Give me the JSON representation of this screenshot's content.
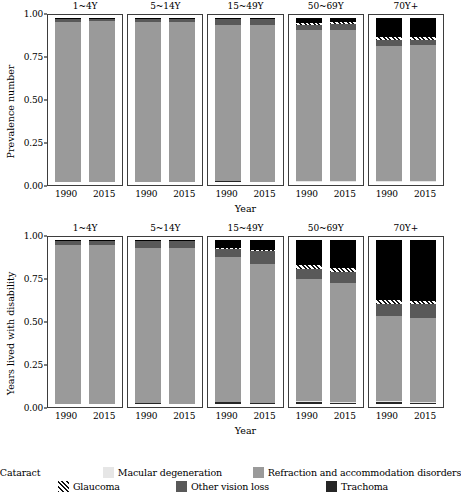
{
  "figure": {
    "xaxis_title": "Year",
    "facets": [
      "1~4Y",
      "5~14Y",
      "15~49Y",
      "50~69Y",
      "70Y+"
    ],
    "years": [
      "1990",
      "2015"
    ]
  },
  "legend": {
    "rows": [
      [
        {
          "label": "Cataract",
          "key": "cataract",
          "color": "#000000",
          "pattern": "solid"
        },
        {
          "label": "Macular degeneration",
          "key": "macular_degeneration",
          "color": "#e6e6e6",
          "pattern": "solid"
        },
        {
          "label": "Refraction and accommodation disorders",
          "key": "refraction",
          "color": "#9a9a9a",
          "pattern": "solid"
        }
      ],
      [
        {
          "label": "Glaucoma",
          "key": "glaucoma",
          "color": "#ffffff",
          "pattern": "hatch"
        },
        {
          "label": "Other vision loss",
          "key": "other_vision_loss",
          "color": "#595959",
          "pattern": "solid"
        },
        {
          "label": "Trachoma",
          "key": "trachoma",
          "color": "#262626",
          "pattern": "solid"
        }
      ]
    ]
  },
  "chart_data": [
    {
      "type": "bar",
      "id": "prevalence",
      "title": "",
      "ylabel": "Prevalence number",
      "xlabel": "Year",
      "ylim": [
        0,
        1
      ],
      "yticks": [
        "0.00",
        "0.25",
        "0.50",
        "0.75",
        "1.00"
      ],
      "ytickvalues": [
        0,
        0.25,
        0.5,
        0.75,
        1
      ],
      "stacked": "fill",
      "grid": false,
      "legend_position": "bottom",
      "series": [
        {
          "name": "Trachoma",
          "key": "trachoma"
        },
        {
          "name": "Macular degeneration",
          "key": "macular_degeneration"
        },
        {
          "name": "Refraction and accommodation disorders",
          "key": "refraction"
        },
        {
          "name": "Other vision loss",
          "key": "other_vision_loss"
        },
        {
          "name": "Glaucoma",
          "key": "glaucoma"
        },
        {
          "name": "Cataract",
          "key": "cataract"
        }
      ],
      "panels": [
        {
          "facet": "1~4Y",
          "bars": [
            {
              "year": "1990",
              "values": {
                "trachoma": 0.001,
                "macular_degeneration": 0.0,
                "refraction": 0.977,
                "other_vision_loss": 0.021,
                "glaucoma": 0.0,
                "cataract": 0.001
              }
            },
            {
              "year": "2015",
              "values": {
                "trachoma": 0.001,
                "macular_degeneration": 0.0,
                "refraction": 0.979,
                "other_vision_loss": 0.019,
                "glaucoma": 0.0,
                "cataract": 0.001
              }
            }
          ]
        },
        {
          "facet": "5~14Y",
          "bars": [
            {
              "year": "1990",
              "values": {
                "trachoma": 0.002,
                "macular_degeneration": 0.0,
                "refraction": 0.972,
                "other_vision_loss": 0.025,
                "glaucoma": 0.0,
                "cataract": 0.001
              }
            },
            {
              "year": "2015",
              "values": {
                "trachoma": 0.002,
                "macular_degeneration": 0.0,
                "refraction": 0.972,
                "other_vision_loss": 0.025,
                "glaucoma": 0.0,
                "cataract": 0.001
              }
            }
          ]
        },
        {
          "facet": "15~49Y",
          "bars": [
            {
              "year": "1990",
              "values": {
                "trachoma": 0.004,
                "macular_degeneration": 0.0,
                "refraction": 0.951,
                "other_vision_loss": 0.038,
                "glaucoma": 0.002,
                "cataract": 0.005
              }
            },
            {
              "year": "2015",
              "values": {
                "trachoma": 0.003,
                "macular_degeneration": 0.0,
                "refraction": 0.952,
                "other_vision_loss": 0.038,
                "glaucoma": 0.002,
                "cataract": 0.005
              }
            }
          ]
        },
        {
          "facet": "50~69Y",
          "bars": [
            {
              "year": "1990",
              "values": {
                "trachoma": 0.005,
                "macular_degeneration": 0.002,
                "refraction": 0.917,
                "other_vision_loss": 0.036,
                "glaucoma": 0.012,
                "cataract": 0.028
              }
            },
            {
              "year": "2015",
              "values": {
                "trachoma": 0.004,
                "macular_degeneration": 0.002,
                "refraction": 0.922,
                "other_vision_loss": 0.034,
                "glaucoma": 0.012,
                "cataract": 0.026
              }
            }
          ]
        },
        {
          "facet": "70Y+",
          "bars": [
            {
              "year": "1990",
              "values": {
                "trachoma": 0.004,
                "macular_degeneration": 0.003,
                "refraction": 0.822,
                "other_vision_loss": 0.034,
                "glaucoma": 0.02,
                "cataract": 0.117
              }
            },
            {
              "year": "2015",
              "values": {
                "trachoma": 0.003,
                "macular_degeneration": 0.003,
                "refraction": 0.828,
                "other_vision_loss": 0.032,
                "glaucoma": 0.016,
                "cataract": 0.118
              }
            }
          ]
        }
      ]
    },
    {
      "type": "bar",
      "id": "ylds",
      "title": "",
      "ylabel": "Years lived with disability",
      "xlabel": "Year",
      "ylim": [
        0,
        1
      ],
      "yticks": [
        "0.00",
        "0.25",
        "0.50",
        "0.75",
        "1.00"
      ],
      "ytickvalues": [
        0,
        0.25,
        0.5,
        0.75,
        1
      ],
      "stacked": "fill",
      "grid": false,
      "legend_position": "bottom",
      "series": [
        {
          "name": "Trachoma",
          "key": "trachoma"
        },
        {
          "name": "Macular degeneration",
          "key": "macular_degeneration"
        },
        {
          "name": "Refraction and accommodation disorders",
          "key": "refraction"
        },
        {
          "name": "Other vision loss",
          "key": "other_vision_loss"
        },
        {
          "name": "Glaucoma",
          "key": "glaucoma"
        },
        {
          "name": "Cataract",
          "key": "cataract"
        }
      ],
      "panels": [
        {
          "facet": "1~4Y",
          "bars": [
            {
              "year": "1990",
              "values": {
                "trachoma": 0.002,
                "macular_degeneration": 0.0,
                "refraction": 0.966,
                "other_vision_loss": 0.029,
                "glaucoma": 0.0,
                "cataract": 0.003
              }
            },
            {
              "year": "2015",
              "values": {
                "trachoma": 0.002,
                "macular_degeneration": 0.0,
                "refraction": 0.967,
                "other_vision_loss": 0.028,
                "glaucoma": 0.0,
                "cataract": 0.003
              }
            }
          ]
        },
        {
          "facet": "5~14Y",
          "bars": [
            {
              "year": "1990",
              "values": {
                "trachoma": 0.004,
                "macular_degeneration": 0.0,
                "refraction": 0.946,
                "other_vision_loss": 0.046,
                "glaucoma": 0.0,
                "cataract": 0.004
              }
            },
            {
              "year": "2015",
              "values": {
                "trachoma": 0.003,
                "macular_degeneration": 0.0,
                "refraction": 0.948,
                "other_vision_loss": 0.045,
                "glaucoma": 0.0,
                "cataract": 0.004
              }
            }
          ]
        },
        {
          "facet": "15~49Y",
          "bars": [
            {
              "year": "1990",
              "values": {
                "trachoma": 0.012,
                "macular_degeneration": 0.0,
                "refraction": 0.883,
                "other_vision_loss": 0.05,
                "glaucoma": 0.004,
                "cataract": 0.051
              }
            },
            {
              "year": "2015",
              "values": {
                "trachoma": 0.009,
                "macular_degeneration": 0.0,
                "refraction": 0.846,
                "other_vision_loss": 0.08,
                "glaucoma": 0.005,
                "cataract": 0.06
              }
            }
          ]
        },
        {
          "facet": "50~69Y",
          "bars": [
            {
              "year": "1990",
              "values": {
                "trachoma": 0.014,
                "macular_degeneration": 0.004,
                "refraction": 0.742,
                "other_vision_loss": 0.062,
                "glaucoma": 0.024,
                "cataract": 0.154
              }
            },
            {
              "year": "2015",
              "values": {
                "trachoma": 0.01,
                "macular_degeneration": 0.004,
                "refraction": 0.726,
                "other_vision_loss": 0.068,
                "glaucoma": 0.024,
                "cataract": 0.168
              }
            }
          ]
        },
        {
          "facet": "70Y+",
          "bars": [
            {
              "year": "1990",
              "values": {
                "trachoma": 0.011,
                "macular_degeneration": 0.006,
                "refraction": 0.52,
                "other_vision_loss": 0.072,
                "glaucoma": 0.024,
                "cataract": 0.367
              }
            },
            {
              "year": "2015",
              "values": {
                "trachoma": 0.009,
                "macular_degeneration": 0.006,
                "refraction": 0.508,
                "other_vision_loss": 0.084,
                "glaucoma": 0.022,
                "cataract": 0.371
              }
            }
          ]
        }
      ]
    }
  ]
}
